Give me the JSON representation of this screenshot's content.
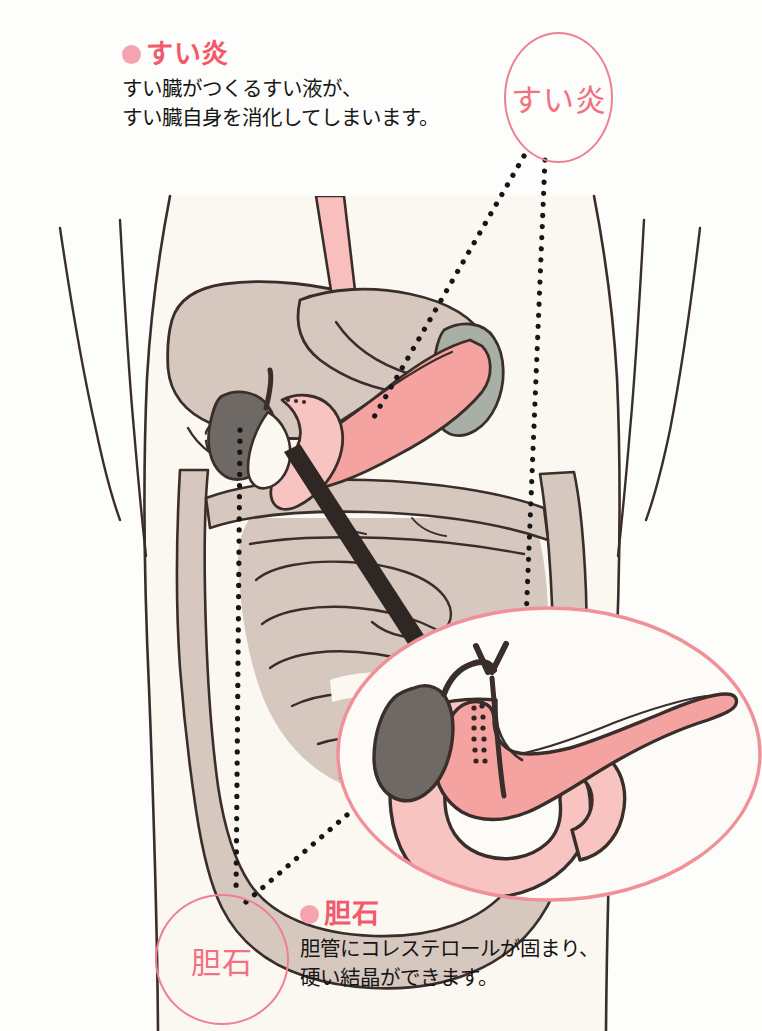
{
  "page": {
    "background_color": "#FDFDFB"
  },
  "colors": {
    "accent_pink": "#F2596B",
    "bullet_pink": "#F4A3AF",
    "bubble_outline": "#EE8090",
    "bubble_text": "#F2707F",
    "oval_outline": "#F09098",
    "body_fill": "#FBF8F2",
    "organ_gray": "#D6C7BF",
    "pancreas_pink": "#F5A3A0",
    "duodenum_pink": "#F7C4C2",
    "stomach_pink": "#F9BFBC",
    "gallbladder_gray": "#6F6966",
    "spleen_gray": "#A8AFA5",
    "outline_dark": "#3A2E2B",
    "body_text": "#161616"
  },
  "callouts": [
    {
      "id": "pancreatitis",
      "bullet_icon": "bullet-dot-icon",
      "heading": "すい炎",
      "lines": [
        "すい臓がつくるすい液が、",
        "すい臓自身を消化してしまいます。"
      ]
    },
    {
      "id": "gallstone",
      "bullet_icon": "bullet-dot-icon",
      "heading": "胆石",
      "lines": [
        "胆管にコレステロールが固まり、",
        "硬い結晶ができます。"
      ]
    }
  ],
  "bubbles": [
    {
      "id": "pancreatitis",
      "label": "すい炎"
    },
    {
      "id": "gallstone",
      "label": "胆石"
    }
  ],
  "illustration": {
    "type": "anatomical-diagram",
    "view": "human torso, anterior view",
    "organs": [
      "liver",
      "stomach",
      "esophagus",
      "pancreas",
      "duodenum",
      "gallbladder",
      "bile duct",
      "spleen",
      "large intestine",
      "small intestine"
    ],
    "magnifier": {
      "shape": "ellipse",
      "contents": [
        "pancreas",
        "duodenum",
        "gallbladder",
        "common bile duct",
        "gallstones"
      ]
    },
    "leader_lines": [
      {
        "from": "bubble-pancreatitis",
        "to": "pancreas-tail-in-torso",
        "style": "dotted"
      },
      {
        "from": "bubble-pancreatitis",
        "to": "pancreas-body-in-magnifier",
        "style": "dotted"
      },
      {
        "from": "bubble-gallstone",
        "to": "gallbladder-in-torso",
        "style": "dotted"
      },
      {
        "from": "bubble-gallstone",
        "to": "gallbladder-in-magnifier",
        "style": "dotted"
      }
    ]
  }
}
